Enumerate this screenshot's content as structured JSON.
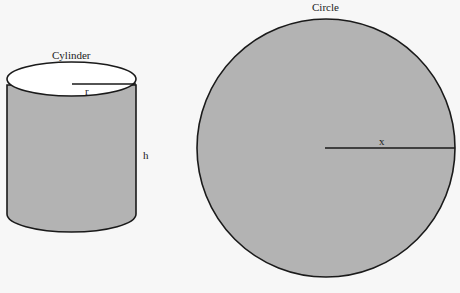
{
  "cylinder": {
    "title": "Cylinder",
    "radius_label": "r",
    "height_label": "h"
  },
  "circle": {
    "title": "Circle",
    "radius_label": "x"
  },
  "colors": {
    "fill": "#b3b3b3",
    "stroke": "#1a1a1a",
    "top_face": "#ffffff",
    "background": "#f7f7f7"
  }
}
